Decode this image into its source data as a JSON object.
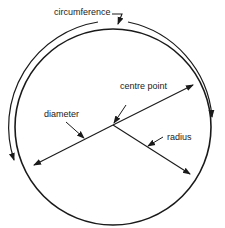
{
  "diagram": {
    "labels": {
      "circumference": "circumference",
      "centre_point": "centre point",
      "diameter": "diameter",
      "radius": "radius"
    },
    "colors": {
      "stroke": "#1a1a1a",
      "background": "#ffffff"
    }
  }
}
